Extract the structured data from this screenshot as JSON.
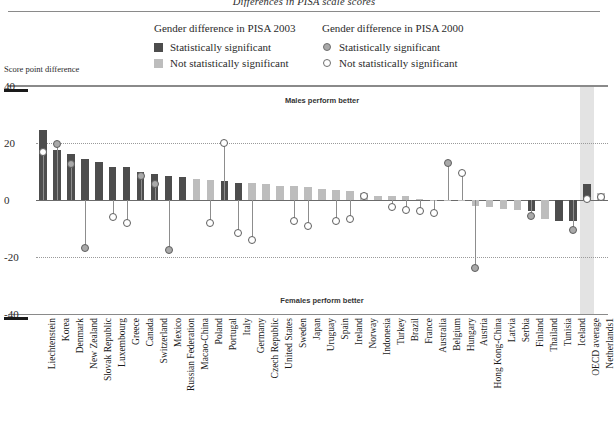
{
  "figure": {
    "title": "Differences in PISA scale scores",
    "axis_caption": "Score point difference",
    "note_top": "Males perform better",
    "note_bottom": "Females perform better"
  },
  "legend": {
    "col1_head": "Gender difference in PISA 2003",
    "col1_items": [
      {
        "label": "Statistically significant",
        "marker": "dark-square-swatch"
      },
      {
        "label": "Not statistically significant",
        "marker": "light-square-swatch"
      }
    ],
    "col2_head": "Gender difference in PISA 2000",
    "col2_items": [
      {
        "label": "Statistically significant",
        "marker": "filled-circle-marker"
      },
      {
        "label": "Not statistically significant",
        "marker": "open-circle-marker"
      }
    ]
  },
  "chart_data": {
    "type": "bar",
    "title": "Differences in PISA scale scores",
    "xlabel": "",
    "ylabel": "Score point difference",
    "ylim": [
      -40,
      40
    ],
    "yticks": [
      40,
      20,
      0,
      -20,
      -40
    ],
    "grid": "dotted horizontal gridlines at 20 and -20",
    "legend_position": "top-center",
    "highlight_band": "Netherlands",
    "categories": [
      "Liechtenstein",
      "Korea",
      "Denmark",
      "New Zealand",
      "Slovak Republic",
      "Luxembourg",
      "Greece",
      "Canada",
      "Switzerland",
      "Mexico",
      "Russian Federation",
      "Macao-China",
      "Poland",
      "Portugal",
      "Italy",
      "Germany",
      "Czech Republic",
      "United States",
      "Sweden",
      "Japan",
      "Uruguay",
      "Spain",
      "Ireland",
      "Norway",
      "Indonesia",
      "Turkey",
      "Brazil",
      "France",
      "Australia",
      "Belgium",
      "Hungary",
      "Austria",
      "Hong Kong-China",
      "Latvia",
      "Serbia",
      "Finland",
      "Thailand",
      "Tunisia",
      "Iceland",
      "OECD average",
      "Netherlands"
    ],
    "series": [
      {
        "name": "Gender difference in PISA 2003",
        "values": [
          24.5,
          17.5,
          16.0,
          14.5,
          13.5,
          11.5,
          11.5,
          10.0,
          9.0,
          8.5,
          8.0,
          7.5,
          7.0,
          6.5,
          6.0,
          6.0,
          5.5,
          5.0,
          5.0,
          4.5,
          4.0,
          3.5,
          3.0,
          2.5,
          1.5,
          1.5,
          1.5,
          0.5,
          -0.5,
          -0.5,
          -0.5,
          -2.0,
          -2.5,
          -3.0,
          -3.5,
          -4.0,
          -6.5,
          -7.5,
          -7.5,
          5.5,
          2.5
        ],
        "significance": [
          "sig",
          "sig",
          "sig",
          "sig",
          "sig",
          "sig",
          "sig",
          "sig",
          "sig",
          "sig",
          "sig",
          "nsig",
          "nsig",
          "sig",
          "sig",
          "nsig",
          "nsig",
          "nsig",
          "nsig",
          "nsig",
          "nsig",
          "nsig",
          "nsig",
          "nsig",
          "nsig",
          "nsig",
          "nsig",
          "nsig",
          "nsig",
          "nsig",
          "nsig",
          "nsig",
          "nsig",
          "nsig",
          "nsig",
          "sig",
          "nsig",
          "sig",
          "sig",
          "sig",
          "nsig"
        ]
      },
      {
        "name": "Gender difference in PISA 2000",
        "values": [
          17.0,
          19.5,
          12.5,
          -17.0,
          null,
          -6.0,
          -8.0,
          8.5,
          5.5,
          -17.5,
          null,
          null,
          -8.0,
          20.0,
          -11.5,
          -14.0,
          null,
          null,
          -7.5,
          -9.0,
          null,
          -7.5,
          -6.5,
          1.5,
          null,
          -2.5,
          -3.5,
          -4.0,
          -4.5,
          13.0,
          9.5,
          -24.0,
          null,
          null,
          null,
          -5.5,
          null,
          null,
          -10.5,
          0.5,
          1.0
        ],
        "significance": [
          "open",
          "filled",
          "filled",
          "filled",
          null,
          "open",
          "open",
          "filled",
          "filled",
          "filled",
          null,
          null,
          "open",
          "open",
          "open",
          "open",
          null,
          null,
          "open",
          "open",
          null,
          "open",
          "open",
          "open",
          null,
          "open",
          "open",
          "open",
          "open",
          "filled",
          "open",
          "filled",
          null,
          null,
          null,
          "filled",
          null,
          null,
          "filled",
          "open",
          "open"
        ]
      }
    ]
  },
  "footnote_marker": "1"
}
